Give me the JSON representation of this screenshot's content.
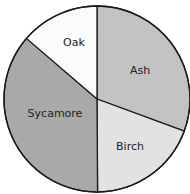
{
  "chart_data": {
    "type": "pie",
    "title": "",
    "categories": [
      "Ash",
      "Birch",
      "Sycamore",
      "Oak"
    ],
    "values": [
      30.6,
      19.3,
      36.4,
      13.7
    ],
    "units": "percent (estimated from slice angles)",
    "start_angle_deg": 0,
    "direction": "clockwise",
    "colors": [
      "#c2c2c2",
      "#e2e2e2",
      "#a9a9a9",
      "#fbfbfb"
    ],
    "labels_inside": true,
    "legend": "none"
  },
  "geometry": {
    "cx": 97,
    "cy": 99,
    "r": 93
  },
  "labels": {
    "ash": "Ash",
    "birch": "Birch",
    "sycamore": "Sycamore",
    "oak": "Oak"
  },
  "label_positions": {
    "ash": [
      140,
      71
    ],
    "birch": [
      130,
      147
    ],
    "sycamore": [
      55,
      114
    ],
    "oak": [
      74,
      43
    ]
  }
}
